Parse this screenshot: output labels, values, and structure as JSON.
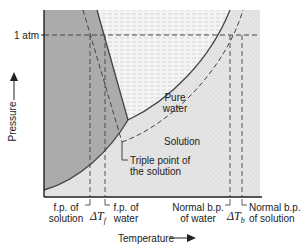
{
  "diagram": {
    "type": "phase-diagram",
    "y_axis_label": "Pressure",
    "x_axis_label": "Temperature",
    "pressure_marker": "1 atm",
    "regions": {
      "liquid_label_line1": "Pure",
      "liquid_label_line2": "water",
      "solution_label": "Solution"
    },
    "callouts": {
      "triple_point_line1": "Triple point of",
      "triple_point_line2": "the solution"
    },
    "x_labels": {
      "fp_solution_line1": "f.p. of",
      "fp_solution_line2": "solution",
      "delta_tf": "ΔT",
      "delta_tf_sub": "f",
      "fp_water_line1": "f.p. of",
      "fp_water_line2": "water",
      "bp_water_line1": "Normal b.p.",
      "bp_water_line2": "of water",
      "delta_tb": "ΔT",
      "delta_tb_sub": "b",
      "bp_solution_line1": "Normal b.p.",
      "bp_solution_line2": "of solution"
    },
    "colors": {
      "solid_region": "#a9a9a9",
      "liquid_region": "#f3f3f3",
      "gas_region": "#e2e2e2",
      "line": "#444444"
    }
  }
}
